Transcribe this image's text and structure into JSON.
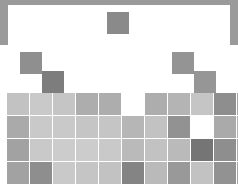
{
  "figure": {
    "background_color": "#ffffff",
    "frame_color": "#9a9a9a",
    "card_color": "#ffffff"
  },
  "chart_data": {
    "type": "heatmap",
    "title": "",
    "subtitle": "",
    "xlabel": "",
    "ylabel": "",
    "grid": false,
    "legend": "none",
    "colormap": "greys",
    "layout": "periodic-table",
    "cell_width": 22,
    "cell_height": 22,
    "col_pitch": 22.6,
    "row_pitch": 22.5,
    "origin_x": 7,
    "origin_y": 12,
    "n_cols": 11,
    "n_rows": 7,
    "value_range": [
      0,
      1
    ],
    "colors": {
      "very_light": "#d3d3d3",
      "light": "#c6c6c6",
      "light_mid": "#bfbfbf",
      "mid_light": "#b5b5b5",
      "mid": "#a8a8a8",
      "mid_dark": "#9a9a9a",
      "dark": "#8a8a8a",
      "darker": "#7d7d7d",
      "darkest": "#6e6e6e"
    },
    "cells": [
      {
        "id": "c-r1-c5",
        "row": 1,
        "col": 5,
        "x": 107,
        "y": 12,
        "w": 22,
        "h": 22,
        "value": 0.58,
        "color": "#8a8a8a"
      },
      {
        "id": "c-r2-c1",
        "row": 2,
        "col": 1,
        "x": 20,
        "y": 52,
        "w": 22,
        "h": 22,
        "value": 0.55,
        "color": "#8f8f8f"
      },
      {
        "id": "c-r2-c9",
        "row": 2,
        "col": 9,
        "x": 172,
        "y": 52,
        "w": 22,
        "h": 22,
        "value": 0.53,
        "color": "#949494"
      },
      {
        "id": "c-r2b-c2",
        "row": 3,
        "col": 2,
        "x": 42,
        "y": 71,
        "w": 22,
        "h": 22,
        "value": 0.66,
        "color": "#7d7d7d"
      },
      {
        "id": "c-r2b-c10",
        "row": 3,
        "col": 10,
        "x": 194,
        "y": 71,
        "w": 22,
        "h": 22,
        "value": 0.52,
        "color": "#969696"
      },
      {
        "id": "c-r3-c1",
        "row": 4,
        "col": 1,
        "x": 7,
        "y": 93,
        "w": 22,
        "h": 22,
        "value": 0.26,
        "color": "#c2c2c2"
      },
      {
        "id": "c-r3-c2",
        "row": 4,
        "col": 2,
        "x": 30,
        "y": 93,
        "w": 22,
        "h": 22,
        "value": 0.22,
        "color": "#c9c9c9"
      },
      {
        "id": "c-r3-c3",
        "row": 4,
        "col": 3,
        "x": 53,
        "y": 93,
        "w": 22,
        "h": 22,
        "value": 0.24,
        "color": "#c5c5c5"
      },
      {
        "id": "c-r3-c4",
        "row": 4,
        "col": 4,
        "x": 76,
        "y": 93,
        "w": 22,
        "h": 22,
        "value": 0.38,
        "color": "#adadad"
      },
      {
        "id": "c-r3-c5",
        "row": 4,
        "col": 5,
        "x": 99,
        "y": 93,
        "w": 22,
        "h": 22,
        "value": 0.38,
        "color": "#adadad"
      },
      {
        "id": "c-r3-c7",
        "row": 4,
        "col": 7,
        "x": 145,
        "y": 93,
        "w": 22,
        "h": 22,
        "value": 0.38,
        "color": "#adadad"
      },
      {
        "id": "c-r3-c8",
        "row": 4,
        "col": 8,
        "x": 168,
        "y": 93,
        "w": 22,
        "h": 22,
        "value": 0.34,
        "color": "#b4b4b4"
      },
      {
        "id": "c-r3-c9",
        "row": 4,
        "col": 9,
        "x": 191,
        "y": 93,
        "w": 22,
        "h": 22,
        "value": 0.24,
        "color": "#c5c5c5"
      },
      {
        "id": "c-r3-c10",
        "row": 4,
        "col": 10,
        "x": 214,
        "y": 93,
        "w": 22,
        "h": 22,
        "value": 0.56,
        "color": "#8e8e8e"
      },
      {
        "id": "c-r3-c11",
        "row": 4,
        "col": 11,
        "x": 237,
        "y": 93,
        "w": 10,
        "h": 22,
        "value": 0.42,
        "color": "#a6a6a6"
      },
      {
        "id": "c-r4-c1",
        "row": 5,
        "col": 1,
        "x": 7,
        "y": 116,
        "w": 22,
        "h": 22,
        "value": 0.4,
        "color": "#aaaaaa"
      },
      {
        "id": "c-r4-c2",
        "row": 5,
        "col": 2,
        "x": 30,
        "y": 116,
        "w": 22,
        "h": 22,
        "value": 0.22,
        "color": "#c9c9c9"
      },
      {
        "id": "c-r4-c3",
        "row": 5,
        "col": 3,
        "x": 53,
        "y": 116,
        "w": 22,
        "h": 22,
        "value": 0.22,
        "color": "#c9c9c9"
      },
      {
        "id": "c-r4-c4",
        "row": 5,
        "col": 4,
        "x": 76,
        "y": 116,
        "w": 22,
        "h": 22,
        "value": 0.24,
        "color": "#c5c5c5"
      },
      {
        "id": "c-r4-c5",
        "row": 5,
        "col": 5,
        "x": 99,
        "y": 116,
        "w": 22,
        "h": 22,
        "value": 0.24,
        "color": "#c5c5c5"
      },
      {
        "id": "c-r4-c6",
        "row": 5,
        "col": 6,
        "x": 122,
        "y": 116,
        "w": 22,
        "h": 22,
        "value": 0.33,
        "color": "#b6b6b6"
      },
      {
        "id": "c-r4-c7",
        "row": 5,
        "col": 7,
        "x": 145,
        "y": 116,
        "w": 22,
        "h": 22,
        "value": 0.26,
        "color": "#c2c2c2"
      },
      {
        "id": "c-r4-c8",
        "row": 5,
        "col": 8,
        "x": 168,
        "y": 116,
        "w": 22,
        "h": 22,
        "value": 0.54,
        "color": "#929292"
      },
      {
        "id": "c-r4-c10",
        "row": 5,
        "col": 10,
        "x": 214,
        "y": 116,
        "w": 22,
        "h": 22,
        "value": 0.4,
        "color": "#aaaaaa"
      },
      {
        "id": "c-r4-c11",
        "row": 5,
        "col": 11,
        "x": 237,
        "y": 116,
        "w": 10,
        "h": 22,
        "value": 0.34,
        "color": "#b4b4b4"
      },
      {
        "id": "c-r5-c1",
        "row": 6,
        "col": 1,
        "x": 7,
        "y": 139,
        "w": 22,
        "h": 22,
        "value": 0.44,
        "color": "#a2a2a2"
      },
      {
        "id": "c-r5-c2",
        "row": 6,
        "col": 2,
        "x": 30,
        "y": 139,
        "w": 22,
        "h": 22,
        "value": 0.22,
        "color": "#c9c9c9"
      },
      {
        "id": "c-r5-c3",
        "row": 6,
        "col": 3,
        "x": 53,
        "y": 139,
        "w": 22,
        "h": 22,
        "value": 0.2,
        "color": "#cccccc"
      },
      {
        "id": "c-r5-c4",
        "row": 6,
        "col": 4,
        "x": 76,
        "y": 139,
        "w": 22,
        "h": 22,
        "value": 0.2,
        "color": "#cccccc"
      },
      {
        "id": "c-r5-c5",
        "row": 6,
        "col": 5,
        "x": 99,
        "y": 139,
        "w": 22,
        "h": 22,
        "value": 0.22,
        "color": "#c9c9c9"
      },
      {
        "id": "c-r5-c6",
        "row": 6,
        "col": 6,
        "x": 122,
        "y": 139,
        "w": 22,
        "h": 22,
        "value": 0.3,
        "color": "#bababa"
      },
      {
        "id": "c-r5-c7",
        "row": 6,
        "col": 7,
        "x": 145,
        "y": 139,
        "w": 22,
        "h": 22,
        "value": 0.26,
        "color": "#c2c2c2"
      },
      {
        "id": "c-r5-c8",
        "row": 6,
        "col": 8,
        "x": 168,
        "y": 139,
        "w": 22,
        "h": 22,
        "value": 0.3,
        "color": "#bababa"
      },
      {
        "id": "c-r5-c9",
        "row": 6,
        "col": 9,
        "x": 191,
        "y": 139,
        "w": 22,
        "h": 22,
        "value": 0.7,
        "color": "#757575"
      },
      {
        "id": "c-r5-c10",
        "row": 6,
        "col": 10,
        "x": 214,
        "y": 139,
        "w": 22,
        "h": 22,
        "value": 0.56,
        "color": "#8e8e8e"
      },
      {
        "id": "c-r5-c11",
        "row": 6,
        "col": 11,
        "x": 237,
        "y": 139,
        "w": 10,
        "h": 22,
        "value": 0.4,
        "color": "#aaaaaa"
      },
      {
        "id": "c-r6-c1",
        "row": 7,
        "col": 1,
        "x": 7,
        "y": 162,
        "w": 22,
        "h": 22,
        "value": 0.44,
        "color": "#a2a2a2"
      },
      {
        "id": "c-r6-c2",
        "row": 7,
        "col": 2,
        "x": 30,
        "y": 162,
        "w": 22,
        "h": 22,
        "value": 0.56,
        "color": "#8e8e8e"
      },
      {
        "id": "c-r6-c3",
        "row": 7,
        "col": 3,
        "x": 53,
        "y": 162,
        "w": 22,
        "h": 22,
        "value": 0.22,
        "color": "#c9c9c9"
      },
      {
        "id": "c-r6-c4",
        "row": 7,
        "col": 4,
        "x": 76,
        "y": 162,
        "w": 22,
        "h": 22,
        "value": 0.24,
        "color": "#c5c5c5"
      },
      {
        "id": "c-r6-c5",
        "row": 7,
        "col": 5,
        "x": 99,
        "y": 162,
        "w": 22,
        "h": 22,
        "value": 0.26,
        "color": "#c2c2c2"
      },
      {
        "id": "c-r6-c6",
        "row": 7,
        "col": 6,
        "x": 122,
        "y": 162,
        "w": 22,
        "h": 22,
        "value": 0.62,
        "color": "#848484"
      },
      {
        "id": "c-r6-c7",
        "row": 7,
        "col": 7,
        "x": 145,
        "y": 162,
        "w": 22,
        "h": 22,
        "value": 0.3,
        "color": "#bababa"
      },
      {
        "id": "c-r6-c8",
        "row": 7,
        "col": 8,
        "x": 168,
        "y": 162,
        "w": 22,
        "h": 22,
        "value": 0.5,
        "color": "#999999"
      },
      {
        "id": "c-r6-c9",
        "row": 7,
        "col": 9,
        "x": 191,
        "y": 162,
        "w": 22,
        "h": 22,
        "value": 0.26,
        "color": "#c2c2c2"
      },
      {
        "id": "c-r6-c10",
        "row": 7,
        "col": 10,
        "x": 214,
        "y": 162,
        "w": 22,
        "h": 22,
        "value": 0.54,
        "color": "#929292"
      },
      {
        "id": "c-r6-c11",
        "row": 7,
        "col": 11,
        "x": 237,
        "y": 162,
        "w": 10,
        "h": 22,
        "value": 0.42,
        "color": "#a6a6a6"
      }
    ]
  }
}
